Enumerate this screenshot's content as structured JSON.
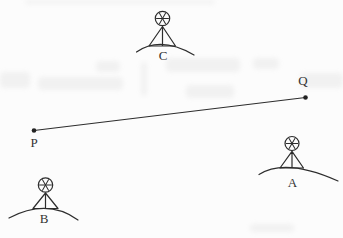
{
  "figure": {
    "type": "diagram",
    "background_color": "#fcfcfc",
    "ink_color": "#2d2d2d",
    "baseline": {
      "from_label": "P",
      "to_label": "Q"
    },
    "stations": [
      {
        "label": "A",
        "icon": "survey-station-icon",
        "position": "lower-right"
      },
      {
        "label": "B",
        "icon": "survey-station-icon",
        "position": "lower-left"
      },
      {
        "label": "C",
        "icon": "survey-station-icon",
        "position": "top-center"
      }
    ]
  }
}
